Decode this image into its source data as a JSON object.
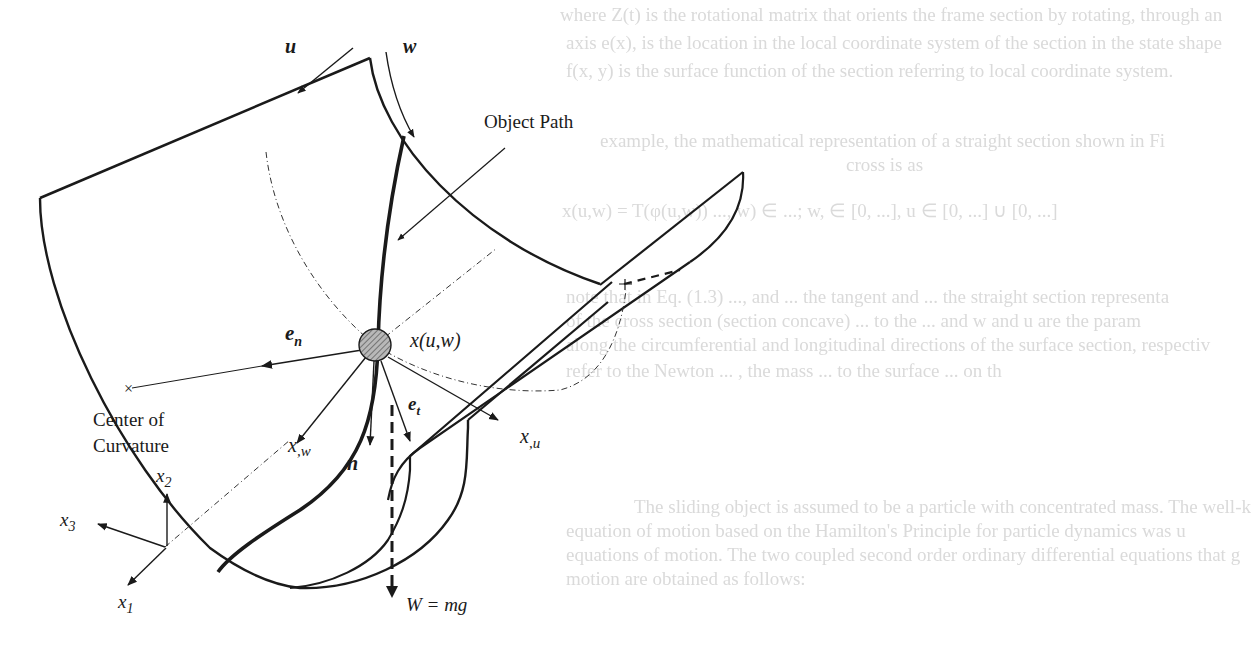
{
  "figure": {
    "labels": {
      "u": "u",
      "w": "w",
      "object_path": "Object Path",
      "position": "x(u,w)",
      "e_n": "e",
      "e_n_sub": "n",
      "e_t": "e",
      "e_t_sub": "t",
      "x_w": "x",
      "x_w_sub": ",w",
      "x_u": "x",
      "x_u_sub": ",u",
      "n": "n",
      "center_line1": "Center of",
      "center_line2": "Curvature",
      "weight": "W = mg",
      "axis_x1": "x",
      "axis_x1_sub": "1",
      "axis_x2": "x",
      "axis_x2_sub": "2",
      "axis_x3": "x",
      "axis_x3_sub": "3"
    },
    "center_marker": "×",
    "colors": {
      "ink": "#1a1a1a",
      "bleed_text": "#d9d9d9",
      "particle_fill": "#a0a0a0",
      "background": "#ffffff"
    }
  },
  "bleed_through": {
    "lines": [
      "where Z(t) is the rotational matrix that orients the frame section by rotating, through an",
      "axis e(x), is the location in the local coordinate system of the section in the state shape",
      "f(x, y) is the surface function of the section referring to local coordinate system.",
      "example, the mathematical representation of a straight section shown in Fi",
      "cross is as",
      "x(u,w) = T(φ(u,w)) ..., w) ∈ ...; w, ∈ [0, ...],  u ∈ [0, ...] ∪ [0, ...]",
      "note that in Eq. (1.3) ..., and ... the tangent and ... the straight section representa",
      "of the cross section (section concave) ... to the ... and w and u are the param",
      "along the circumferential and longitudinal directions of the surface section, respectiv",
      "refer to the Newton ... , the mass ... to the surface ... on th",
      "The sliding object is assumed to be a particle with concentrated mass. The well-k",
      "equation of motion based on the Hamilton's Principle for particle dynamics was u",
      "equations of motion. The two coupled second order ordinary differential equations that g",
      "motion are obtained as follows:"
    ]
  }
}
